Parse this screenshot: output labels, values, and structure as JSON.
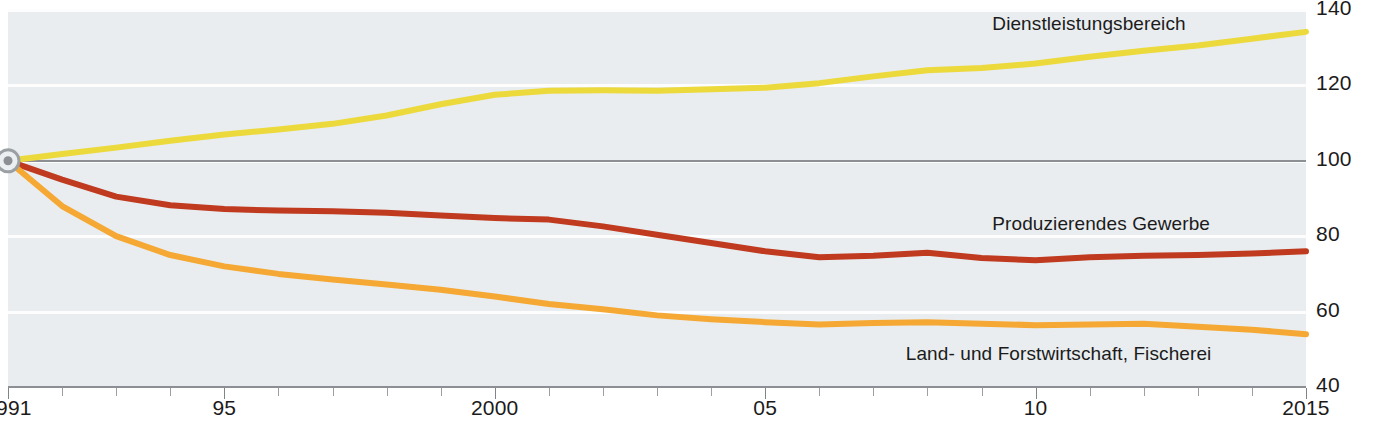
{
  "chart_data": {
    "type": "line",
    "title": "",
    "xlabel": "",
    "ylabel": "",
    "index_base": "1991 = 100",
    "xlim": [
      1991,
      2015
    ],
    "ylim": [
      40,
      140
    ],
    "grid": true,
    "legend": "inline-labels",
    "x": [
      1991,
      1992,
      1993,
      1994,
      1995,
      1996,
      1997,
      1998,
      1999,
      2000,
      2001,
      2002,
      2003,
      2004,
      2005,
      2006,
      2007,
      2008,
      2009,
      2010,
      2011,
      2012,
      2013,
      2014,
      2015
    ],
    "y_ticks": [
      40,
      60,
      80,
      100,
      120,
      140
    ],
    "x_tick_labels": [
      {
        "value": 1991,
        "label": "1991"
      },
      {
        "value": 1995,
        "label": "95"
      },
      {
        "value": 2000,
        "label": "2000"
      },
      {
        "value": 2005,
        "label": "05"
      },
      {
        "value": 2010,
        "label": "10"
      },
      {
        "value": 2015,
        "label": "2015"
      }
    ],
    "reference_line": 100,
    "series": [
      {
        "name": "Dienstleistungsbereich",
        "color": "#ecd93c",
        "label_x": 2009.2,
        "label_y": 136.0,
        "values": [
          100.0,
          101.8,
          103.5,
          105.3,
          107.0,
          108.3,
          109.8,
          112.0,
          115.0,
          117.5,
          118.6,
          118.7,
          118.6,
          119.0,
          119.4,
          120.6,
          122.4,
          124.0,
          124.6,
          125.8,
          127.6,
          129.2,
          130.6,
          132.4,
          134.2
        ]
      },
      {
        "name": "Produzierendes Gewerbe",
        "color": "#bf3a1e",
        "label_x": 2009.2,
        "label_y": 83.0,
        "values": [
          100.0,
          95.0,
          90.5,
          88.2,
          87.2,
          86.8,
          86.6,
          86.2,
          85.5,
          84.8,
          84.4,
          82.6,
          80.4,
          78.2,
          76.0,
          74.4,
          74.8,
          75.6,
          74.2,
          73.6,
          74.4,
          74.8,
          75.0,
          75.4,
          76.0
        ]
      },
      {
        "name": "Land- und Forstwirtschaft, Fischerei",
        "color": "#f5a833",
        "label_x": 2007.6,
        "label_y": 48.6,
        "values": [
          100.0,
          88.0,
          80.0,
          75.0,
          72.0,
          70.0,
          68.5,
          67.2,
          65.8,
          64.0,
          62.0,
          60.6,
          59.0,
          58.0,
          57.2,
          56.6,
          57.0,
          57.2,
          56.8,
          56.4,
          56.6,
          56.8,
          56.0,
          55.2,
          54.0
        ]
      }
    ],
    "origin_marker": {
      "x": 1991,
      "y": 100,
      "name": "index-origin-marker"
    }
  },
  "caption": ""
}
